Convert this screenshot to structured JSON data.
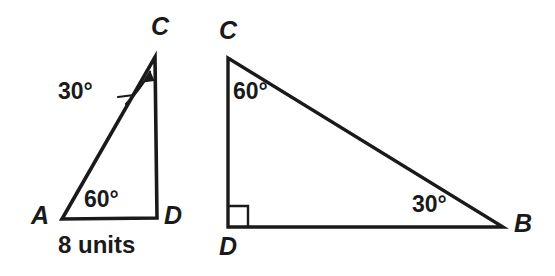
{
  "figure": {
    "background_color": "#ffffff",
    "stroke_color": "#1a1a1a",
    "text_color": "#1a1a1a",
    "width": 555,
    "height": 276
  },
  "left_triangle": {
    "name": "triangle-ACD",
    "vertices": [
      {
        "label": "A",
        "x": 62,
        "y": 219
      },
      {
        "label": "C",
        "x": 155,
        "y": 57
      },
      {
        "label": "D",
        "x": 157,
        "y": 218
      }
    ],
    "vertex_labels": {
      "a": "A",
      "c": "C",
      "d": "D"
    },
    "angles": {
      "at_c": "30°",
      "at_a": "60°"
    },
    "side_label": "8 units",
    "has_leader_arrow_to_c": true
  },
  "right_triangle": {
    "name": "triangle-CDB",
    "vertices": [
      {
        "label": "C",
        "x": 228,
        "y": 58
      },
      {
        "label": "D",
        "x": 228,
        "y": 227
      },
      {
        "label": "B",
        "x": 503,
        "y": 227
      }
    ],
    "vertex_labels": {
      "c": "C",
      "d": "D",
      "b": "B"
    },
    "angles": {
      "at_c": "60°",
      "at_b": "30°",
      "at_d": "right-angle-marker"
    },
    "right_angle_marker": true
  },
  "chart_data": {
    "type": "diagram",
    "shapes": [
      {
        "name": "triangle-ACD",
        "type": "triangle",
        "points": [
          [
            62,
            219
          ],
          [
            155,
            57
          ],
          [
            157,
            218
          ]
        ],
        "vertex_labels": [
          "A",
          "C",
          "D"
        ],
        "angle_labels": [
          {
            "at": "A",
            "value": "60°"
          },
          {
            "at": "C",
            "value": "30°"
          },
          {
            "at": "D",
            "value": ""
          }
        ],
        "side_labels": [
          {
            "side": "AD",
            "value": "8 units"
          }
        ]
      },
      {
        "name": "triangle-CDB",
        "type": "triangle",
        "points": [
          [
            228,
            58
          ],
          [
            228,
            227
          ],
          [
            503,
            227
          ]
        ],
        "vertex_labels": [
          "C",
          "D",
          "B"
        ],
        "angle_labels": [
          {
            "at": "C",
            "value": "60°"
          },
          {
            "at": "B",
            "value": "30°"
          },
          {
            "at": "D",
            "value": "90° (square marker)"
          }
        ],
        "side_labels": []
      }
    ]
  }
}
